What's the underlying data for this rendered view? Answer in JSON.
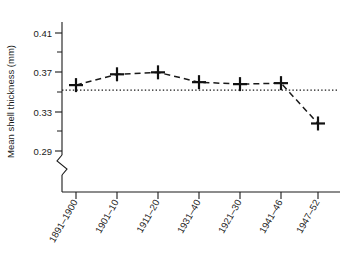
{
  "chart_data": {
    "type": "line",
    "title": "",
    "xlabel": "",
    "ylabel": "Mean shell thickness (mm)",
    "categories": [
      "1891–1900",
      "1901–10",
      "1911–20",
      "1931–40",
      "1921–30",
      "1941–46",
      "1947–52"
    ],
    "values": [
      0.357,
      0.368,
      0.37,
      0.36,
      0.358,
      0.359,
      0.318
    ],
    "series": [
      {
        "name": "Mean shell thickness",
        "values": [
          0.357,
          0.368,
          0.37,
          0.36,
          0.358,
          0.359,
          0.318
        ],
        "marker": "plus",
        "linestyle": "dashed",
        "color": "#1a1a1a"
      }
    ],
    "reference_line": {
      "name": "baseline",
      "value": 0.352,
      "linestyle": "dotted",
      "color": "#1a1a1a"
    },
    "ylim": [
      0.29,
      0.425
    ],
    "y_ticks": [
      0.29,
      0.33,
      0.37,
      0.41
    ],
    "y_tick_labels": [
      "0.29",
      "0.33",
      "0.37",
      "0.41"
    ],
    "y_minor_ticks": [
      0.31,
      0.35,
      0.39
    ],
    "grid": false,
    "legend": false,
    "axis_break": true,
    "axis_break_note": "y-axis broken below 0.29"
  },
  "axes": {
    "y_title": "Mean shell thickness (mm)",
    "y_tick_labels": [
      "0.41",
      "0.37",
      "0.33",
      "0.29"
    ],
    "x_tick_labels": [
      "1891–1900",
      "1901–10",
      "1911–20",
      "1931–40",
      "1921–30",
      "1941–46",
      "1947–52"
    ]
  }
}
